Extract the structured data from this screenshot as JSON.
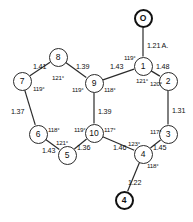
{
  "diagram": {
    "units_note": "1.21 Å",
    "atoms": [
      {
        "id": "a1",
        "label": "1",
        "kind": "ring",
        "x": 143,
        "y": 66
      },
      {
        "id": "a2",
        "label": "2",
        "kind": "ring",
        "x": 168,
        "y": 81
      },
      {
        "id": "a3",
        "label": "3",
        "kind": "ring",
        "x": 168,
        "y": 134
      },
      {
        "id": "a4",
        "label": "4",
        "kind": "ring",
        "x": 143,
        "y": 154
      },
      {
        "id": "a5",
        "label": "5",
        "kind": "ring",
        "x": 67,
        "y": 155
      },
      {
        "id": "a6",
        "label": "6",
        "kind": "ring",
        "x": 38,
        "y": 134
      },
      {
        "id": "a7",
        "label": "7",
        "kind": "ring",
        "x": 22,
        "y": 81
      },
      {
        "id": "a8",
        "label": "8",
        "kind": "ring",
        "x": 58,
        "y": 57
      },
      {
        "id": "a9",
        "label": "9",
        "kind": "ring",
        "x": 94,
        "y": 83
      },
      {
        "id": "a10",
        "label": "10",
        "kind": "ring",
        "x": 94,
        "y": 133
      },
      {
        "id": "o1",
        "label": "O",
        "kind": "terminal",
        "x": 143,
        "y": 18
      },
      {
        "id": "o4",
        "label": "4",
        "kind": "terminal",
        "x": 124,
        "y": 200
      }
    ],
    "bond_lengths": [
      {
        "id": "bl-o1-1",
        "value": "1.21 A.",
        "x": 147,
        "y": 41
      },
      {
        "id": "bl-1-9",
        "value": "1.43",
        "x": 110,
        "y": 62
      },
      {
        "id": "bl-1-2",
        "value": "1.48",
        "x": 156,
        "y": 62
      },
      {
        "id": "bl-2-3",
        "value": "1.31",
        "x": 172,
        "y": 106
      },
      {
        "id": "bl-3-4",
        "value": "1.45",
        "x": 153,
        "y": 143
      },
      {
        "id": "bl-4-o4",
        "value": "1.22",
        "x": 128,
        "y": 178
      },
      {
        "id": "bl-4-10",
        "value": "1.46",
        "x": 113,
        "y": 143
      },
      {
        "id": "bl-10-5",
        "value": "1.36",
        "x": 77,
        "y": 143
      },
      {
        "id": "bl-5-6",
        "value": "1.43",
        "x": 42,
        "y": 146
      },
      {
        "id": "bl-6-7",
        "value": "1.37",
        "x": 11,
        "y": 107
      },
      {
        "id": "bl-7-8",
        "value": "1.41",
        "x": 33,
        "y": 62
      },
      {
        "id": "bl-8-9",
        "value": "1.39",
        "x": 76,
        "y": 62
      },
      {
        "id": "bl-9-10",
        "value": "1.39",
        "x": 98,
        "y": 107
      }
    ],
    "bond_angles": [
      {
        "id": "ang-1-left",
        "value": "119°",
        "x": 124,
        "y": 54
      },
      {
        "id": "ang-1-down",
        "value": "121°",
        "x": 136,
        "y": 77
      },
      {
        "id": "ang-2",
        "value": "120°",
        "x": 150,
        "y": 80
      },
      {
        "id": "ang-3",
        "value": "117°",
        "x": 150,
        "y": 128
      },
      {
        "id": "ang-4-left",
        "value": "123°",
        "x": 128,
        "y": 140
      },
      {
        "id": "ang-4-right",
        "value": "118°",
        "x": 147,
        "y": 162
      },
      {
        "id": "ang-10-left",
        "value": "119°",
        "x": 74,
        "y": 126
      },
      {
        "id": "ang-10-right",
        "value": "117°",
        "x": 104,
        "y": 126
      },
      {
        "id": "ang-5",
        "value": "121°",
        "x": 56,
        "y": 139
      },
      {
        "id": "ang-6",
        "value": "118°",
        "x": 48,
        "y": 126
      },
      {
        "id": "ang-7",
        "value": "119°",
        "x": 33,
        "y": 85
      },
      {
        "id": "ang-8",
        "value": "121°",
        "x": 52,
        "y": 74
      },
      {
        "id": "ang-9-left",
        "value": "119°",
        "x": 72,
        "y": 86
      },
      {
        "id": "ang-9-right",
        "value": "118°",
        "x": 104,
        "y": 86
      }
    ],
    "bonds": [
      {
        "id": "b-o1-1",
        "from": "o1",
        "to": "a1"
      },
      {
        "id": "b-1-2",
        "from": "a1",
        "to": "a2"
      },
      {
        "id": "b-2-3",
        "from": "a2",
        "to": "a3"
      },
      {
        "id": "b-3-4",
        "from": "a3",
        "to": "a4"
      },
      {
        "id": "b-4-o4",
        "from": "a4",
        "to": "o4"
      },
      {
        "id": "b-4-10",
        "from": "a4",
        "to": "a10"
      },
      {
        "id": "b-10-5",
        "from": "a10",
        "to": "a5"
      },
      {
        "id": "b-5-6",
        "from": "a5",
        "to": "a6"
      },
      {
        "id": "b-6-7",
        "from": "a6",
        "to": "a7"
      },
      {
        "id": "b-7-8",
        "from": "a7",
        "to": "a8"
      },
      {
        "id": "b-8-9",
        "from": "a8",
        "to": "a9"
      },
      {
        "id": "b-9-1",
        "from": "a9",
        "to": "a1"
      },
      {
        "id": "b-9-10",
        "from": "a9",
        "to": "a10"
      }
    ],
    "colors": {
      "line": "#2b2b2b",
      "terminal": "#111111",
      "background": "#ffffff"
    }
  }
}
